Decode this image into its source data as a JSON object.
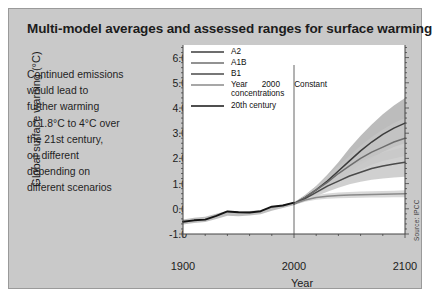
{
  "figure": {
    "title": "Multi-model averages and assessed ranges for surface warming",
    "source": "Source: IPCC",
    "panel_bg": "#c9c9c9",
    "plot_bg": "#ffffff"
  },
  "caption": {
    "lines": [
      "Continued emissions",
      "would lead to",
      "further warming",
      "of 1.8°C to 4°C over",
      "the 21st century,",
      "on different",
      "depending on",
      "different scenarios"
    ]
  },
  "chart_data": {
    "type": "line",
    "title": "Multi-model averages and assessed ranges for surface warming",
    "xlabel": "Year",
    "ylabel": "Global surface warning (°C)",
    "xlim": [
      1900,
      2100
    ],
    "ylim": [
      -1.0,
      6.5
    ],
    "xticks": [
      1900,
      2000,
      2100
    ],
    "xtick_labels": [
      "1900",
      "2000",
      "2100"
    ],
    "xticks_minor_step": 20,
    "yticks": [
      -1.0,
      0.0,
      1.0,
      2.0,
      3.0,
      4.0,
      5.0,
      6.0
    ],
    "ytick_labels": [
      "-1.0",
      "0.0",
      "1.0",
      "2.0",
      "3.0",
      "4.0",
      "5.0",
      "6.0"
    ],
    "yticks_minor_step": 0.2,
    "grid": false,
    "legend_position": "top-left-inside",
    "divider_year": 2000,
    "annotations": [
      {
        "kind": "vline",
        "x": 2000,
        "label": "year-2000-divider"
      }
    ],
    "series": [
      {
        "name": "A2",
        "color": "#3c3c3c",
        "band_color": "#b0b0b0",
        "x": [
          2000,
          2010,
          2020,
          2030,
          2040,
          2050,
          2060,
          2070,
          2080,
          2090,
          2100
        ],
        "values": [
          0.2,
          0.45,
          0.75,
          1.1,
          1.5,
          1.9,
          2.3,
          2.65,
          2.95,
          3.2,
          3.4
        ],
        "band_low": [
          0.15,
          0.35,
          0.6,
          0.85,
          1.15,
          1.45,
          1.75,
          2.0,
          2.25,
          2.45,
          2.6
        ],
        "band_high": [
          0.25,
          0.55,
          0.9,
          1.35,
          1.85,
          2.4,
          2.9,
          3.35,
          3.75,
          4.1,
          4.4
        ]
      },
      {
        "name": "A1B",
        "color": "#6e6e6e",
        "band_color": "#c4c4c4",
        "x": [
          2000,
          2010,
          2020,
          2030,
          2040,
          2050,
          2060,
          2070,
          2080,
          2090,
          2100
        ],
        "values": [
          0.2,
          0.45,
          0.75,
          1.05,
          1.4,
          1.7,
          2.0,
          2.25,
          2.45,
          2.65,
          2.8
        ],
        "band_low": [
          0.15,
          0.35,
          0.6,
          0.85,
          1.1,
          1.35,
          1.55,
          1.75,
          1.9,
          2.0,
          2.1
        ],
        "band_high": [
          0.25,
          0.55,
          0.9,
          1.3,
          1.7,
          2.1,
          2.5,
          2.85,
          3.15,
          3.4,
          3.6
        ]
      },
      {
        "name": "B1",
        "color": "#4a4a4a",
        "band_color": "#c8c8c8",
        "x": [
          2000,
          2010,
          2020,
          2030,
          2040,
          2050,
          2060,
          2070,
          2080,
          2090,
          2100
        ],
        "values": [
          0.2,
          0.4,
          0.65,
          0.9,
          1.1,
          1.3,
          1.45,
          1.6,
          1.7,
          1.78,
          1.85
        ],
        "band_low": [
          0.15,
          0.3,
          0.5,
          0.68,
          0.84,
          0.97,
          1.07,
          1.15,
          1.2,
          1.24,
          1.27
        ],
        "band_high": [
          0.25,
          0.5,
          0.8,
          1.12,
          1.4,
          1.66,
          1.88,
          2.07,
          2.22,
          2.34,
          2.45
        ]
      },
      {
        "name": "Year 2000 Constant concentrations",
        "color": "#8a8a8a",
        "band_color": "#d2d2d2",
        "x": [
          2000,
          2010,
          2020,
          2030,
          2040,
          2050,
          2060,
          2070,
          2080,
          2090,
          2100
        ],
        "values": [
          0.2,
          0.35,
          0.45,
          0.5,
          0.53,
          0.55,
          0.56,
          0.57,
          0.58,
          0.59,
          0.6
        ],
        "band_low": [
          0.15,
          0.28,
          0.36,
          0.4,
          0.42,
          0.43,
          0.44,
          0.45,
          0.45,
          0.46,
          0.46
        ],
        "band_high": [
          0.25,
          0.43,
          0.55,
          0.61,
          0.65,
          0.67,
          0.69,
          0.7,
          0.71,
          0.72,
          0.74
        ]
      },
      {
        "name": "20th century",
        "color": "#141414",
        "band_color": "#b5b5b5",
        "x": [
          1900,
          1910,
          1920,
          1930,
          1940,
          1950,
          1960,
          1970,
          1980,
          1990,
          2000
        ],
        "values": [
          -0.52,
          -0.46,
          -0.42,
          -0.3,
          -0.18,
          -0.2,
          -0.18,
          -0.14,
          0.0,
          0.1,
          0.2
        ],
        "band_low": [
          -0.62,
          -0.56,
          -0.52,
          -0.4,
          -0.28,
          -0.3,
          -0.27,
          -0.22,
          -0.08,
          0.03,
          0.14
        ],
        "band_high": [
          -0.42,
          -0.36,
          -0.32,
          -0.2,
          -0.08,
          -0.1,
          -0.09,
          -0.06,
          0.08,
          0.17,
          0.26
        ]
      }
    ],
    "legend": [
      {
        "label": "A2",
        "color": "#3c3c3c"
      },
      {
        "label": "A1B",
        "color": "#6e6e6e"
      },
      {
        "label": "B1",
        "color": "#4a4a4a"
      },
      {
        "label": "Year 2000 Constant",
        "label2": "concentrations",
        "color": "#8a8a8a"
      },
      {
        "label": "20th century",
        "color": "#141414"
      }
    ]
  }
}
